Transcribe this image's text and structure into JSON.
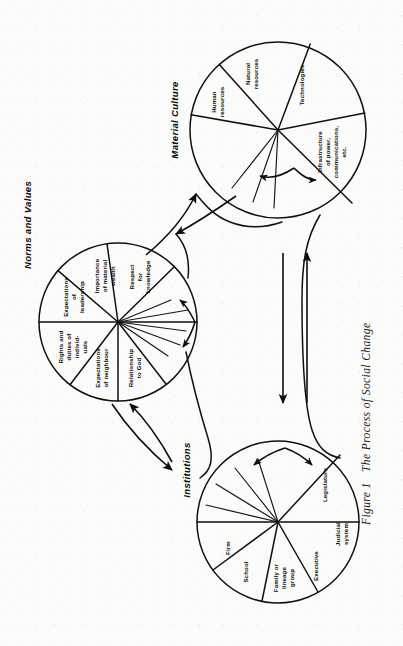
{
  "figure": {
    "caption_number": "Figure 1",
    "caption_text": "The Process of Social Change",
    "orientation": "rotated-90-ccw",
    "background_color": "#fbfbfa",
    "ink_color": "#0a0a0a"
  },
  "circles": [
    {
      "id": "material-culture",
      "title": "Material Culture",
      "center": {
        "x": 278,
        "y": 130
      },
      "radius": 88,
      "segments": [
        {
          "label": "Human resources"
        },
        {
          "label": "Natural resources"
        },
        {
          "label": "Technologies"
        },
        {
          "label": "Infrastructure of power, communications, etc."
        }
      ]
    },
    {
      "id": "norms-and-values",
      "title": "Norms and Values",
      "center": {
        "x": 118,
        "y": 322
      },
      "radius": 79,
      "segments": [
        {
          "label": "Expectations of leadership"
        },
        {
          "label": "Importance of material wealth"
        },
        {
          "label": "Respect for knowledge"
        },
        {
          "label": "Rights and duties of individ-uals"
        },
        {
          "label": "Expectations of neighbour"
        },
        {
          "label": "Relationship to God"
        }
      ]
    },
    {
      "id": "institutions",
      "title": "Institutions",
      "center": {
        "x": 278,
        "y": 522
      },
      "radius": 81,
      "segments": [
        {
          "label": "Firm"
        },
        {
          "label": "School"
        },
        {
          "label": "Family or lineage group"
        },
        {
          "label": "Executive"
        },
        {
          "label": "Judicial system"
        },
        {
          "label": "Legislature"
        }
      ]
    }
  ],
  "segment_text": {
    "human_resources_l1": "Human",
    "human_resources_l2": "resources",
    "natural_resources_l1": "Natural",
    "natural_resources_l2": "resources",
    "technologies_l1": "Technologies",
    "infrastructure_l1": "Infrastructure",
    "infrastructure_l2": "of power,",
    "infrastructure_l3": "communications,",
    "infrastructure_l4": "etc.",
    "expect_leadership_l1": "Expectations",
    "expect_leadership_l2": "of",
    "expect_leadership_l3": "leadership",
    "importance_wealth_l1": "Importance",
    "importance_wealth_l2": "of material",
    "importance_wealth_l3": "wealth",
    "respect_knowledge_l1": "Respect",
    "respect_knowledge_l2": "for",
    "respect_knowledge_l3": "knowledge",
    "rights_duties_l1": "Rights and",
    "rights_duties_l2": "duties of",
    "rights_duties_l3": "individ-",
    "rights_duties_l4": "uals",
    "expect_neighbour_l1": "Expectations",
    "expect_neighbour_l2": "of neighbour",
    "relationship_god_l1": "Relationship",
    "relationship_god_l2": "to God",
    "firm_l1": "Firm",
    "school_l1": "School",
    "family_l1": "Family or",
    "family_l2": "lineage",
    "family_l3": "group",
    "executive_l1": "Executive",
    "judicial_l1": "Judicial",
    "judicial_l2": "system",
    "legislature_l1": "Legislature"
  },
  "connectors": [
    {
      "id": "mc-nv-up",
      "from": "norms-and-values",
      "to": "material-culture",
      "style": "curved-arrow"
    },
    {
      "id": "mc-nv-down",
      "from": "material-culture",
      "to": "norms-and-values",
      "style": "curved-arrow"
    },
    {
      "id": "nv-inst-down",
      "from": "norms-and-values",
      "to": "institutions",
      "style": "curved-arrow"
    },
    {
      "id": "inst-nv-up",
      "from": "institutions",
      "to": "norms-and-values",
      "style": "curved-arrow"
    },
    {
      "id": "mc-inst-down",
      "from": "material-culture",
      "to": "institutions",
      "style": "straight-arrow"
    },
    {
      "id": "inst-mc-up",
      "from": "institutions",
      "to": "material-culture",
      "style": "straight-arrow"
    },
    {
      "id": "mc-self-loop",
      "from": "material-culture",
      "to": "material-culture",
      "style": "double-headed-loop"
    },
    {
      "id": "nv-self-loop",
      "from": "norms-and-values",
      "to": "norms-and-values",
      "style": "double-headed-loop"
    },
    {
      "id": "inst-self-loop",
      "from": "institutions",
      "to": "institutions",
      "style": "double-headed-loop"
    }
  ]
}
